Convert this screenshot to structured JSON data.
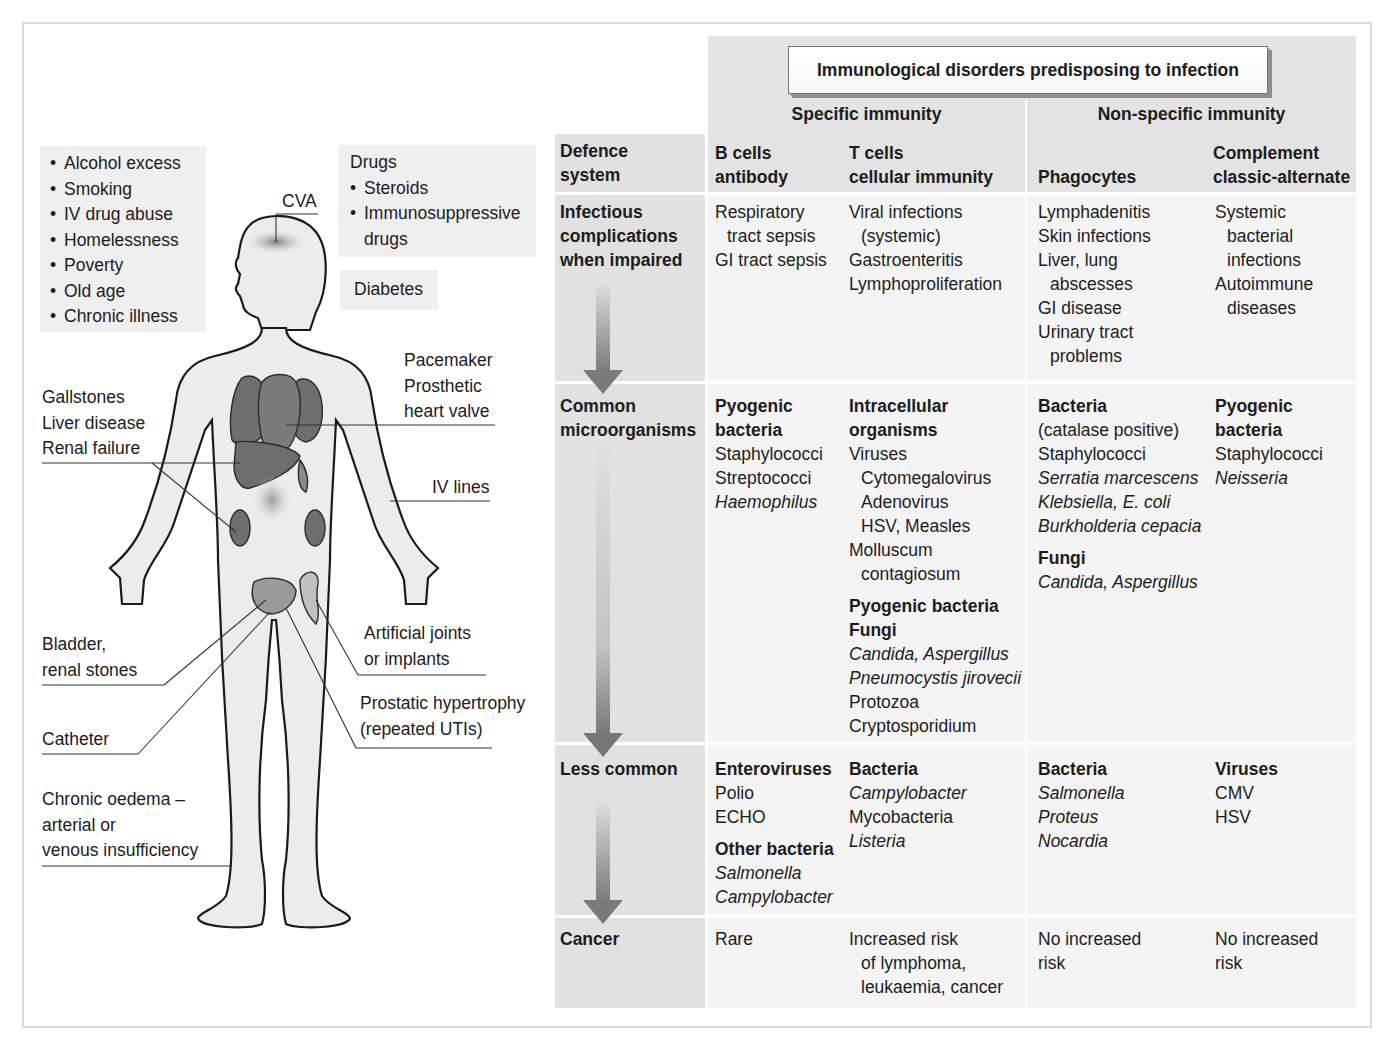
{
  "figure": {
    "risk_factors": {
      "items": [
        "Alcohol excess",
        "Smoking",
        "IV drug abuse",
        "Homelessness",
        "Poverty",
        "Old age",
        "Chronic illness"
      ]
    },
    "drugs": {
      "heading": "Drugs",
      "items": [
        "Steroids",
        "Immunosuppressive",
        "drugs"
      ]
    },
    "diabetes": "Diabetes",
    "body_labels": {
      "cva": "CVA",
      "gallstones": "Gallstones",
      "liver_disease": "Liver disease",
      "renal_failure": "Renal failure",
      "pacemaker": "Pacemaker",
      "prosthetic": "Prosthetic",
      "heart_valve": "heart valve",
      "iv_lines": "IV lines",
      "bladder": "Bladder,",
      "renal_stones": "renal stones",
      "artificial_joints": "Artificial joints",
      "or_implants": "or implants",
      "catheter": "Catheter",
      "prostatic": "Prostatic hypertrophy",
      "repeated_utis": "(repeated UTIs)",
      "oedema_1": "Chronic oedema –",
      "oedema_2": "arterial or",
      "oedema_3": "venous insufficiency"
    }
  },
  "table": {
    "title": "Immunological disorders predisposing to infection",
    "groups": {
      "specific": "Specific immunity",
      "nonspecific": "Non-specific immunity"
    },
    "columns": {
      "defence": [
        "Defence",
        "system"
      ],
      "bcells": [
        "B cells",
        "antibody"
      ],
      "tcells": [
        "T cells",
        "cellular immunity"
      ],
      "phagocytes": [
        "Phagocytes"
      ],
      "complement": [
        "Complement",
        "classic-alternate"
      ]
    },
    "rows": {
      "infectious": {
        "head": [
          "Infectious",
          "complications",
          "when impaired"
        ],
        "bcells": [
          "Respiratory",
          "tract sepsis",
          "GI tract sepsis"
        ],
        "tcells": [
          "Viral infections",
          "(systemic)",
          "Gastroenteritis",
          "Lymphoproliferation"
        ],
        "phagocytes": [
          "Lymphadenitis",
          "Skin infections",
          "Liver, lung",
          "abscesses",
          "GI disease",
          "Urinary tract",
          "problems"
        ],
        "complement": [
          "Systemic",
          "bacterial",
          "infections",
          "Autoimmune",
          "diseases"
        ]
      },
      "common": {
        "head": [
          "Common",
          "microorganisms"
        ],
        "bcells": [
          "Pyogenic",
          "bacteria",
          "Staphylococci",
          "Streptococci",
          "Haemophilus"
        ],
        "tcells": [
          "Intracellular",
          "organisms",
          "Viruses",
          "Cytomegalovirus",
          "Adenovirus",
          "HSV, Measles",
          "Molluscum",
          "contagiosum",
          "Pyogenic bacteria",
          "Fungi",
          "Candida, Aspergillus",
          "Pneumocystis jirovecii",
          "Protozoa",
          "Cryptosporidium"
        ],
        "phagocytes": [
          "Bacteria",
          "(catalase positive)",
          "Staphylococci",
          "Serratia marcescens",
          "Klebsiella, E. coli",
          "Burkholderia cepacia",
          "Fungi",
          "Candida, Aspergillus"
        ],
        "complement": [
          "Pyogenic",
          "bacteria",
          "Staphylococci",
          "Neisseria"
        ]
      },
      "less_common": {
        "head": [
          "Less common"
        ],
        "bcells": [
          "Enteroviruses",
          "Polio",
          "ECHO",
          "Other bacteria",
          "Salmonella",
          "Campylobacter"
        ],
        "tcells": [
          "Bacteria",
          "Campylobacter",
          "Mycobacteria",
          "Listeria"
        ],
        "phagocytes": [
          "Bacteria",
          "Salmonella",
          "Proteus",
          "Nocardia"
        ],
        "complement": [
          "Viruses",
          "CMV",
          "HSV"
        ]
      },
      "cancer": {
        "head": [
          "Cancer"
        ],
        "bcells": [
          "Rare"
        ],
        "tcells": [
          "Increased risk",
          "of lymphoma,",
          "leukaemia, cancer"
        ],
        "phagocytes": [
          "No increased",
          "risk"
        ],
        "complement": [
          "No increased",
          "risk"
        ]
      }
    }
  },
  "colors": {
    "header_bg": "#e3e3e3",
    "rowhead_bg": "#e1e1e1",
    "cell_bg": "#f4f4f4",
    "organ": "#6e6e6e",
    "arrow": "#7a7a7a"
  }
}
